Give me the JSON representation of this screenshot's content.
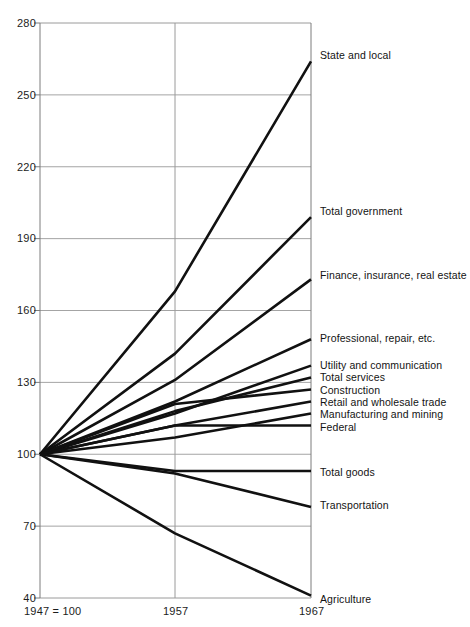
{
  "chart_data": {
    "type": "line",
    "title": "",
    "subtitle": "",
    "xlabel": "",
    "ylabel": "",
    "base_note": "1947 = 100",
    "x": [
      1947,
      1957,
      1967
    ],
    "x_tick_labels": [
      "1957",
      "1967"
    ],
    "y_tick_labels": [
      "280",
      "250",
      "220",
      "190",
      "160",
      "130",
      "100",
      "70",
      "40"
    ],
    "y_ticks": [
      280,
      250,
      220,
      190,
      160,
      130,
      100,
      70,
      40
    ],
    "ylim": [
      40,
      280
    ],
    "grid": "horizontal-and-vertical",
    "legend_position": "right-inline-labels",
    "series": [
      {
        "name": "State and local",
        "values": [
          100,
          168,
          264
        ]
      },
      {
        "name": "Total government",
        "values": [
          100,
          142,
          199
        ]
      },
      {
        "name": "Finance, insurance, real estate",
        "values": [
          100,
          131,
          173
        ]
      },
      {
        "name": "Professional, repair, etc.",
        "values": [
          100,
          122,
          148
        ]
      },
      {
        "name": "Utility and communication",
        "values": [
          100,
          117,
          137
        ]
      },
      {
        "name": "Total services",
        "values": [
          100,
          118,
          132
        ]
      },
      {
        "name": "Construction",
        "values": [
          100,
          121,
          127
        ]
      },
      {
        "name": "Retail and wholesale trade",
        "values": [
          100,
          112,
          122
        ]
      },
      {
        "name": "Manufacturing and mining",
        "values": [
          100,
          107,
          117
        ]
      },
      {
        "name": "Federal",
        "values": [
          100,
          112,
          112
        ]
      },
      {
        "name": "Total goods",
        "values": [
          100,
          93,
          93
        ]
      },
      {
        "name": "Transportation",
        "values": [
          100,
          92,
          78
        ]
      },
      {
        "name": "Agriculture",
        "values": [
          100,
          67,
          41
        ]
      }
    ],
    "colors": {
      "line": "#111111",
      "axis": "#7d7d7d",
      "grid": "#9a9a9a",
      "background": "#ffffff",
      "text": "#1a1a1a"
    }
  }
}
